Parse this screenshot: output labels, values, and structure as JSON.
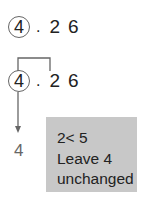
{
  "number1": {
    "circled": "4",
    "point": ".",
    "d1": "2",
    "d2": "6"
  },
  "number2": {
    "circled": "4",
    "point": ".",
    "d1": "2",
    "d2": "6"
  },
  "result": "4",
  "note": {
    "line1": "2< 5",
    "line2": "Leave 4",
    "line3": "unchanged"
  },
  "colors": {
    "box": "#c8c8c8",
    "lines": "#666666"
  }
}
